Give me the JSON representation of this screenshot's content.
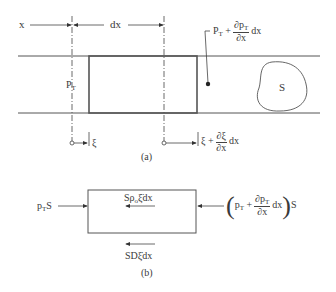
{
  "figure": {
    "part_a": {
      "caption": "(a)",
      "x_label": "x",
      "dx_label": "dx",
      "pressure_left": {
        "base": "P",
        "sub": "T"
      },
      "pressure_right": {
        "base": "P",
        "sub": "T",
        "plus": "+",
        "frac_num": "∂p",
        "frac_num_sub": "T",
        "frac_den": "∂x",
        "tail": "dx"
      },
      "area_label": "S",
      "disp_left": "ξ",
      "disp_right": {
        "base": "ξ",
        "plus": "+",
        "frac_num": "∂ξ",
        "frac_den": "∂x",
        "tail": "dx"
      }
    },
    "part_b": {
      "caption": "(b)",
      "force_left": {
        "base": "p",
        "sub": "T",
        "tail": "S"
      },
      "inertia_force": {
        "pre": "Sρ",
        "sub": "o",
        "mid": "ξ̈",
        "tail": "dx"
      },
      "force_right": {
        "open": "(",
        "base": "p",
        "sub": "T",
        "plus": "+",
        "frac_num": "∂p",
        "frac_num_sub": "T",
        "frac_den": "∂x",
        "tail": "dx",
        "close": ")",
        "after": "S"
      },
      "damping_force": {
        "pre": "SD",
        "mid": "ξ̇",
        "tail": "dx"
      }
    },
    "colors": {
      "line": "#4a4a4a",
      "box": "#555555",
      "background": "#ffffff"
    }
  }
}
